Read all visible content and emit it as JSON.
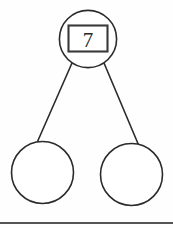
{
  "figure": {
    "whole": {
      "label": "7",
      "box_border_color": "#3a3a3a",
      "circle_border_color": "#2b2b2b"
    },
    "parts": [
      {
        "label": "",
        "name": "part-left"
      },
      {
        "label": "",
        "name": "part-right"
      }
    ],
    "connectors": [
      {
        "name": "branch-left"
      },
      {
        "name": "branch-right"
      }
    ],
    "background_color": "#fefefe",
    "stroke_color": "#2b2b2b",
    "footer_rule_color": "#1d1d1d"
  }
}
